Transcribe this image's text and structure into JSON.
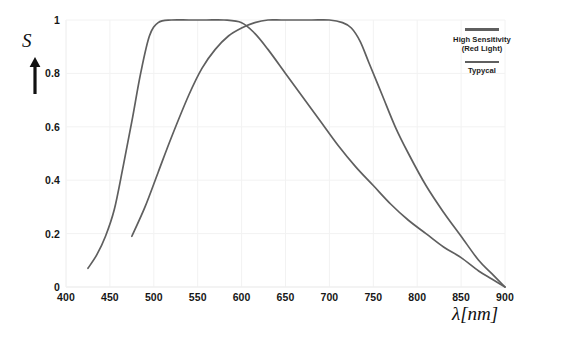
{
  "chart_data": {
    "type": "line",
    "title": "",
    "xlabel": "λ[nm]",
    "ylabel": "S",
    "xlim": [
      400,
      900
    ],
    "ylim": [
      0,
      1
    ],
    "grid": true,
    "legend_position": "top-right",
    "x_ticks": [
      400,
      450,
      500,
      550,
      600,
      650,
      700,
      750,
      800,
      850,
      900
    ],
    "y_ticks": [
      "0",
      "0.2",
      "0.4",
      "0.6",
      "0.8",
      "1"
    ],
    "series": [
      {
        "name": "Typycal",
        "color": "#5f5f5f",
        "x": [
          425,
          435,
          445,
          455,
          465,
          475,
          485,
          495,
          505,
          520,
          540,
          560,
          580,
          600,
          615,
          630,
          650,
          670,
          690,
          710,
          730,
          750,
          770,
          790,
          810,
          830,
          850,
          870,
          885,
          900
        ],
        "y": [
          0.07,
          0.12,
          0.19,
          0.29,
          0.45,
          0.62,
          0.8,
          0.94,
          0.99,
          1.0,
          1.0,
          1.0,
          1.0,
          0.99,
          0.95,
          0.89,
          0.8,
          0.71,
          0.62,
          0.53,
          0.45,
          0.38,
          0.31,
          0.25,
          0.2,
          0.15,
          0.11,
          0.06,
          0.03,
          0.0
        ]
      },
      {
        "name": "High Sensitivity (Red Light)",
        "color": "#5f5f5f",
        "x": [
          475,
          490,
          505,
          520,
          540,
          555,
          570,
          585,
          600,
          615,
          630,
          645,
          660,
          680,
          700,
          715,
          725,
          735,
          745,
          760,
          775,
          790,
          810,
          830,
          850,
          870,
          885,
          900
        ],
        "y": [
          0.19,
          0.3,
          0.43,
          0.56,
          0.72,
          0.82,
          0.89,
          0.94,
          0.97,
          0.99,
          1.0,
          1.0,
          1.0,
          1.0,
          1.0,
          0.99,
          0.97,
          0.92,
          0.84,
          0.72,
          0.6,
          0.5,
          0.38,
          0.28,
          0.19,
          0.1,
          0.05,
          0.0
        ]
      }
    ]
  },
  "axis": {
    "y_title": "S",
    "x_title": "λ[nm]"
  },
  "legend": {
    "entries": [
      {
        "label_line1": "High Sensitivity",
        "label_line2": "(Red Light)"
      },
      {
        "label_line1": "Typycal",
        "label_line2": ""
      }
    ]
  },
  "colors": {
    "curve": "#5f5f5f",
    "text": "#171717",
    "grid": "#f2f2f2",
    "background": "#ffffff"
  }
}
